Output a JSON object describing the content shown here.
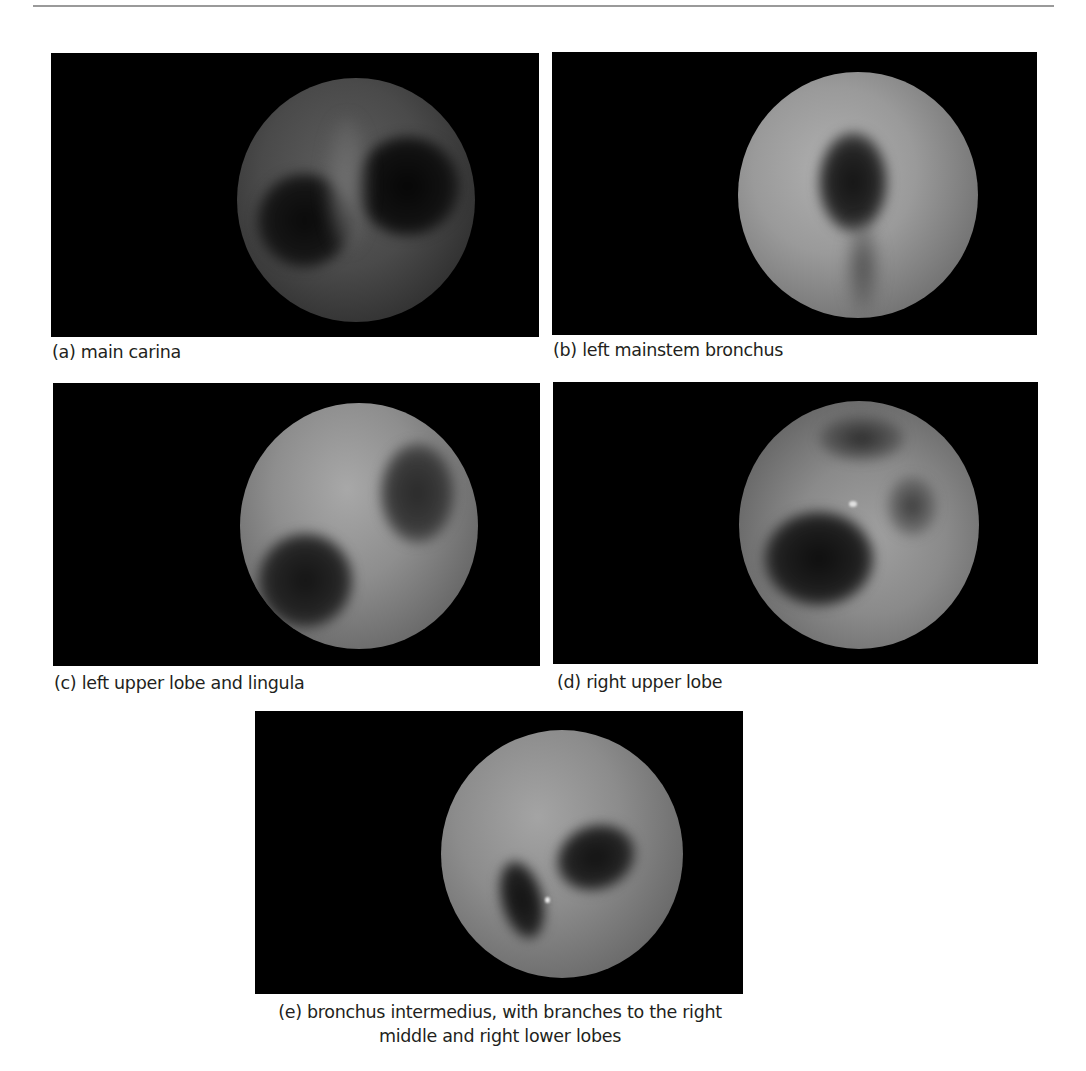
{
  "figure": {
    "panels": [
      {
        "id": "a",
        "label": "(a)",
        "caption": "(a) main carina",
        "image_description": "Bronchoscopic view of the main carina: dim circular field with two dark airway openings separated by a ridge"
      },
      {
        "id": "b",
        "label": "(b)",
        "caption": "(b) left mainstem bronchus",
        "image_description": "Bronchoscopic view of the left mainstem bronchus: bright circular field with a single dark central lumen"
      },
      {
        "id": "c",
        "label": "(c)",
        "caption": "(c) left upper lobe and lingula",
        "image_description": "Bronchoscopic view showing two dark openings (left upper lobe and lingula) at lower-left and upper-right"
      },
      {
        "id": "d",
        "label": "(d)",
        "caption": "(d) right upper lobe",
        "image_description": "Bronchoscopic view of the right upper lobe with a large lumen lower-left and smaller openings above and right"
      },
      {
        "id": "e",
        "label": "(e)",
        "caption_line1": "(e) bronchus intermedius, with branches to the right",
        "caption_line2": "middle and right lower lobes",
        "image_description": "Bronchoscopic view of bronchus intermedius with two dark openings to the right middle and right lower lobes"
      }
    ],
    "colors": {
      "panel_background": "#000000",
      "caption_text": "#231f20",
      "header_rule": "#9a9a9a"
    }
  }
}
